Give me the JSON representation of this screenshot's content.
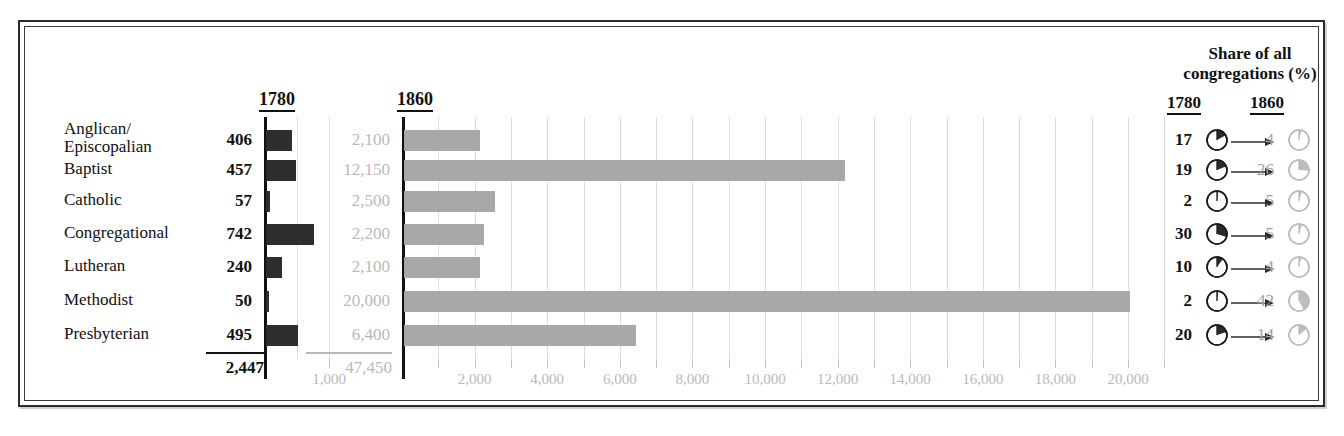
{
  "chart_data": {
    "type": "bar",
    "title": "",
    "panels": [
      {
        "name": "1780",
        "label": "1780",
        "xlim": [
          0,
          1200
        ],
        "gridlines": [
          500,
          1000
        ],
        "tick_labels": [
          {
            "value": 1000,
            "label": "1,000"
          }
        ],
        "total": "2,447"
      },
      {
        "name": "1860",
        "label": "1860",
        "xlim": [
          0,
          21500
        ],
        "gridline_step": 1000,
        "tick_labels": [
          {
            "value": 2000,
            "label": "2,000"
          },
          {
            "value": 4000,
            "label": "4,000"
          },
          {
            "value": 6000,
            "label": "6,000"
          },
          {
            "value": 8000,
            "label": "8,000"
          },
          {
            "value": 10000,
            "label": "10,000"
          },
          {
            "value": 12000,
            "label": "12,000"
          },
          {
            "value": 14000,
            "label": "14,000"
          },
          {
            "value": 16000,
            "label": "16,000"
          },
          {
            "value": 18000,
            "label": "18,000"
          },
          {
            "value": 20000,
            "label": "20,000"
          }
        ],
        "total": "47,450"
      }
    ],
    "categories": [
      "Anglican/\nEpiscopalian",
      "Baptist",
      "Catholic",
      "Congregational",
      "Lutheran",
      "Methodist",
      "Presbyterian"
    ],
    "series": [
      {
        "name": "1780",
        "values": [
          406,
          457,
          57,
          742,
          240,
          50,
          495
        ],
        "labels": [
          "406",
          "457",
          "57",
          "742",
          "240",
          "50",
          "495"
        ],
        "color": "#2e2e2e"
      },
      {
        "name": "1860",
        "values": [
          2100,
          12150,
          2500,
          2200,
          2100,
          20000,
          6400
        ],
        "labels": [
          "2,100",
          "12,150",
          "2,500",
          "2,200",
          "2,100",
          "20,000",
          "6,400"
        ],
        "color": "#a8a8a8"
      }
    ],
    "share": {
      "title_line1": "Share of all",
      "title_line2": "congregations (%)",
      "col1_label": "1780",
      "col2_label": "1860",
      "rows": [
        {
          "p1780": "17",
          "p1860": "4"
        },
        {
          "p1780": "19",
          "p1860": "26"
        },
        {
          "p1780": "2",
          "p1860": "5"
        },
        {
          "p1780": "30",
          "p1860": "5"
        },
        {
          "p1780": "10",
          "p1860": "4"
        },
        {
          "p1780": "2",
          "p1860": "42"
        },
        {
          "p1780": "20",
          "p1860": "14"
        }
      ]
    }
  }
}
